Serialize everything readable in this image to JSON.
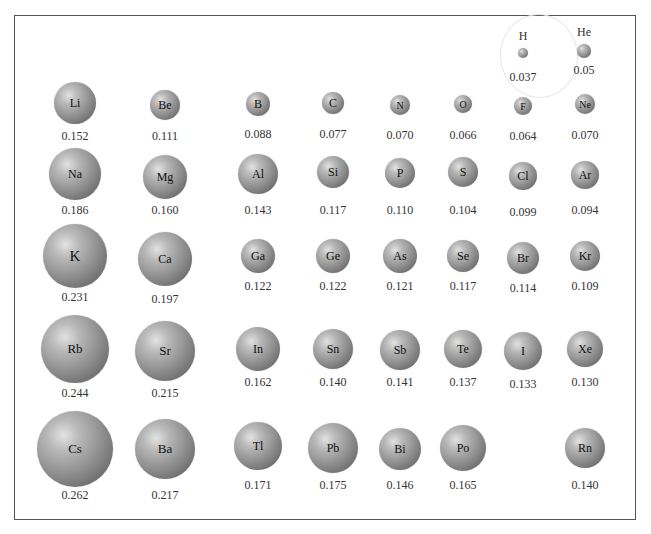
{
  "chart_data": {
    "type": "table",
    "unit": "nm",
    "layout": "periodic-table grid, sphere size proportional to radius",
    "elements": [
      {
        "symbol": "H",
        "value": "0.037",
        "cx": 523,
        "cy": 53,
        "r": 5,
        "label_above": true,
        "vy": 70
      },
      {
        "symbol": "He",
        "value": "0.05",
        "cx": 584,
        "cy": 51,
        "r": 7,
        "label_above": true,
        "vy": 63
      },
      {
        "symbol": "Li",
        "value": "0.152",
        "cx": 75,
        "cy": 103,
        "r": 21,
        "vy": 129
      },
      {
        "symbol": "Be",
        "value": "0.111",
        "cx": 165,
        "cy": 105,
        "r": 15,
        "vy": 129
      },
      {
        "symbol": "B",
        "value": "0.088",
        "cx": 258,
        "cy": 104,
        "r": 12,
        "vy": 127
      },
      {
        "symbol": "C",
        "value": "0.077",
        "cx": 333,
        "cy": 103,
        "r": 11,
        "vy": 127
      },
      {
        "symbol": "N",
        "value": "0.070",
        "cx": 400,
        "cy": 105,
        "r": 10,
        "vy": 128
      },
      {
        "symbol": "O",
        "value": "0.066",
        "cx": 463,
        "cy": 104,
        "r": 9,
        "vy": 128
      },
      {
        "symbol": "F",
        "value": "0.064",
        "cx": 523,
        "cy": 106,
        "r": 9,
        "vy": 129
      },
      {
        "symbol": "Ne",
        "value": "0.070",
        "cx": 585,
        "cy": 104,
        "r": 10,
        "vy": 128
      },
      {
        "symbol": "Na",
        "value": "0.186",
        "cx": 75,
        "cy": 174,
        "r": 26,
        "vy": 203
      },
      {
        "symbol": "Mg",
        "value": "0.160",
        "cx": 165,
        "cy": 177,
        "r": 22,
        "vy": 203
      },
      {
        "symbol": "Al",
        "value": "0.143",
        "cx": 258,
        "cy": 174,
        "r": 20,
        "vy": 203
      },
      {
        "symbol": "Si",
        "value": "0.117",
        "cx": 333,
        "cy": 172,
        "r": 16,
        "vy": 203
      },
      {
        "symbol": "P",
        "value": "0.110",
        "cx": 400,
        "cy": 173,
        "r": 15,
        "vy": 203
      },
      {
        "symbol": "S",
        "value": "0.104",
        "cx": 463,
        "cy": 172,
        "r": 15,
        "vy": 203
      },
      {
        "symbol": "Cl",
        "value": "0.099",
        "cx": 523,
        "cy": 176,
        "r": 14,
        "vy": 205
      },
      {
        "symbol": "Ar",
        "value": "0.094",
        "cx": 585,
        "cy": 175,
        "r": 14,
        "vy": 203
      },
      {
        "symbol": "K",
        "value": "0.231",
        "cx": 75,
        "cy": 256,
        "r": 32,
        "vy": 290
      },
      {
        "symbol": "Ca",
        "value": "0.197",
        "cx": 165,
        "cy": 259,
        "r": 27,
        "vy": 292
      },
      {
        "symbol": "Ga",
        "value": "0.122",
        "cx": 258,
        "cy": 256,
        "r": 17,
        "vy": 279
      },
      {
        "symbol": "Ge",
        "value": "0.122",
        "cx": 333,
        "cy": 256,
        "r": 17,
        "vy": 279
      },
      {
        "symbol": "As",
        "value": "0.121",
        "cx": 400,
        "cy": 256,
        "r": 17,
        "vy": 279
      },
      {
        "symbol": "Se",
        "value": "0.117",
        "cx": 463,
        "cy": 256,
        "r": 16,
        "vy": 279
      },
      {
        "symbol": "Br",
        "value": "0.114",
        "cx": 523,
        "cy": 258,
        "r": 16,
        "vy": 281
      },
      {
        "symbol": "Kr",
        "value": "0.109",
        "cx": 585,
        "cy": 256,
        "r": 15,
        "vy": 279
      },
      {
        "symbol": "Rb",
        "value": "0.244",
        "cx": 75,
        "cy": 349,
        "r": 34,
        "vy": 386
      },
      {
        "symbol": "Sr",
        "value": "0.215",
        "cx": 165,
        "cy": 351,
        "r": 30,
        "vy": 386
      },
      {
        "symbol": "In",
        "value": "0.162",
        "cx": 258,
        "cy": 349,
        "r": 22,
        "vy": 375
      },
      {
        "symbol": "Sn",
        "value": "0.140",
        "cx": 333,
        "cy": 349,
        "r": 20,
        "vy": 375
      },
      {
        "symbol": "Sb",
        "value": "0.141",
        "cx": 400,
        "cy": 350,
        "r": 20,
        "vy": 375
      },
      {
        "symbol": "Te",
        "value": "0.137",
        "cx": 463,
        "cy": 349,
        "r": 19,
        "vy": 375
      },
      {
        "symbol": "I",
        "value": "0.133",
        "cx": 523,
        "cy": 351,
        "r": 19,
        "vy": 377
      },
      {
        "symbol": "Xe",
        "value": "0.130",
        "cx": 585,
        "cy": 349,
        "r": 18,
        "vy": 375
      },
      {
        "symbol": "Cs",
        "value": "0.262",
        "cx": 75,
        "cy": 449,
        "r": 38,
        "vy": 488
      },
      {
        "symbol": "Ba",
        "value": "0.217",
        "cx": 165,
        "cy": 449,
        "r": 30,
        "vy": 488
      },
      {
        "symbol": "Tl",
        "value": "0.171",
        "cx": 258,
        "cy": 446,
        "r": 24,
        "vy": 478
      },
      {
        "symbol": "Pb",
        "value": "0.175",
        "cx": 333,
        "cy": 448,
        "r": 25,
        "vy": 478
      },
      {
        "symbol": "Bi",
        "value": "0.146",
        "cx": 400,
        "cy": 449,
        "r": 21,
        "vy": 478
      },
      {
        "symbol": "Po",
        "value": "0.165",
        "cx": 463,
        "cy": 448,
        "r": 23,
        "vy": 478
      },
      {
        "symbol": "Rn",
        "value": "0.140",
        "cx": 585,
        "cy": 448,
        "r": 20,
        "vy": 478
      }
    ]
  },
  "annotations": {
    "hydrogen_ellipse": "faint outline enclosing H"
  }
}
